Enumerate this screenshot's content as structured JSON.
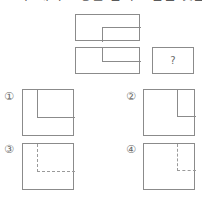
{
  "heading": {
    "text": "그 두 개의 도형을 겹쳐 그림은 것은?",
    "note": "cut-off-top-line"
  },
  "stimulus": {
    "figures": [
      {
        "id": "stimulus-1",
        "shape": "rectangle",
        "inner": "L-shape opening lower-right",
        "line_style": "solid"
      },
      {
        "id": "stimulus-2",
        "shape": "rectangle",
        "inner": "L-shape opening upper-right",
        "line_style": "solid"
      }
    ],
    "answer_placeholder": {
      "label": "?",
      "shape": "rectangle"
    }
  },
  "options": [
    {
      "marker": "①",
      "id": "option-1",
      "shape": "square",
      "line_style": "solid",
      "inner": "vertical line from top, horizontal line to left edge"
    },
    {
      "marker": "②",
      "id": "option-2",
      "shape": "square",
      "line_style": "solid",
      "inner": "vertical line from top at right, horizontal line to right edge"
    },
    {
      "marker": "③",
      "id": "option-3",
      "shape": "square",
      "line_style": "dashed",
      "inner": "dashed vertical from top, dashed horizontal to left edge"
    },
    {
      "marker": "④",
      "id": "option-4",
      "shape": "square",
      "line_style": "dashed",
      "inner": "dashed vertical from top at right, dashed horizontal to right edge"
    }
  ],
  "colors": {
    "line": "#8b8b8b",
    "dashed_line": "#9a9a9a",
    "text": "#6a6a6a",
    "background": "#ffffff"
  }
}
